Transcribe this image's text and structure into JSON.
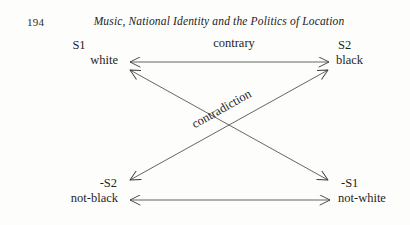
{
  "page": {
    "folio": "194",
    "running_head": "Music, National Identity and the Politics of Location",
    "ink_color": "#1f1f1f",
    "paper_color": "#fdfdfc"
  },
  "diagram": {
    "type": "semiotic-square",
    "nodes": [
      {
        "id": "s1",
        "symbol": "S1",
        "term": "white",
        "position": "top-left"
      },
      {
        "id": "s2",
        "symbol": "S2",
        "term": "black",
        "position": "top-right"
      },
      {
        "id": "ns2",
        "symbol": "-S2",
        "term": "not-black",
        "position": "bottom-left"
      },
      {
        "id": "ns1",
        "symbol": "-S1",
        "term": "not-white",
        "position": "bottom-right"
      }
    ],
    "relations": [
      {
        "id": "top",
        "label": "contrary",
        "from": "s1",
        "to": "s2",
        "arrows": "both"
      },
      {
        "id": "diagonal-1",
        "label": "contradiction",
        "from": "s1",
        "to": "ns1",
        "arrows": "both"
      },
      {
        "id": "diagonal-2",
        "label": "",
        "from": "ns2",
        "to": "s2",
        "arrows": "both"
      },
      {
        "id": "bottom",
        "label": "",
        "from": "ns2",
        "to": "ns1",
        "arrows": "both"
      }
    ],
    "labels": {
      "contrary": "contrary",
      "contradiction": "contradiction"
    }
  }
}
